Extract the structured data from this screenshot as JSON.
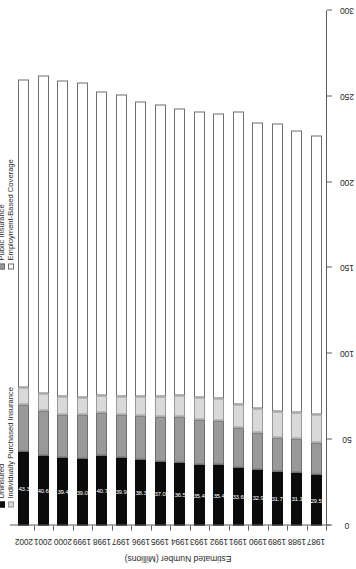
{
  "chart_data": {
    "type": "bar",
    "orientation": "stacked-horizontal-rotated",
    "title": "",
    "subtitle": "",
    "xlabel": "",
    "ylabel": "Estimated Number (Millions)",
    "ylim": [
      0,
      300
    ],
    "yticks": [
      0,
      50,
      100,
      150,
      200,
      250,
      300
    ],
    "grid": false,
    "legend_position": "top-left",
    "categories": [
      "1987",
      "1988",
      "1989",
      "1990",
      "1991",
      "1992",
      "1993",
      "1994",
      "1995",
      "1996",
      "1997",
      "1998",
      "1999",
      "2000",
      "2001",
      "2002"
    ],
    "series": [
      {
        "name": "Uninsured",
        "color": "#0b0b0b",
        "values": [
          29.5,
          31.1,
          31.7,
          32.9,
          33.6,
          35.4,
          35.4,
          36.5,
          37.0,
          38.3,
          39.9,
          40.7,
          39.0,
          39.4,
          40.6,
          43.3
        ],
        "labels": [
          "29.5",
          "31.1",
          "31.7",
          "32.9",
          "33.6",
          "35.4",
          "35.4",
          "36.5",
          "37.0",
          "38.3",
          "39.9",
          "40.7",
          "39.0",
          "39.4",
          "40.6",
          "43.3"
        ]
      },
      {
        "name": "Public Insurance",
        "color": "#999999",
        "values": [
          19.0,
          19.5,
          19.5,
          21.0,
          23.5,
          25.5,
          26.5,
          27.0,
          26.5,
          26.0,
          25.0,
          25.0,
          25.5,
          25.0,
          26.5,
          27.0
        ]
      },
      {
        "name": "Individually Purchased Insurance",
        "color": "#d9d9d9",
        "values": [
          16.0,
          15.5,
          15.0,
          14.0,
          13.5,
          13.0,
          12.5,
          12.0,
          11.5,
          11.0,
          10.5,
          10.0,
          10.0,
          10.5,
          10.0,
          10.0
        ]
      },
      {
        "name": "Employment-Based Coverage",
        "color": "#ffffff",
        "values": [
          162.5,
          163.9,
          167.8,
          167.1,
          170.4,
          166.1,
          166.6,
          167.5,
          170.0,
          171.7,
          175.6,
          177.3,
          183.5,
          184.1,
          184.9,
          179.7
        ]
      }
    ],
    "series_order_from_axis": [
      "Uninsured",
      "Public Insurance",
      "Individually Purchased Insurance",
      "Employment-Based Coverage"
    ]
  },
  "legend": {
    "columns": [
      {
        "items": [
          {
            "label": "Uninsured",
            "swatch": "uninsured"
          },
          {
            "label": "Individually Purchased Insurance",
            "swatch": "individual"
          }
        ]
      },
      {
        "items": [
          {
            "label": "Public Insurance",
            "swatch": "public"
          },
          {
            "label": "Employment-Based Coverage",
            "swatch": "employment"
          }
        ]
      }
    ]
  }
}
